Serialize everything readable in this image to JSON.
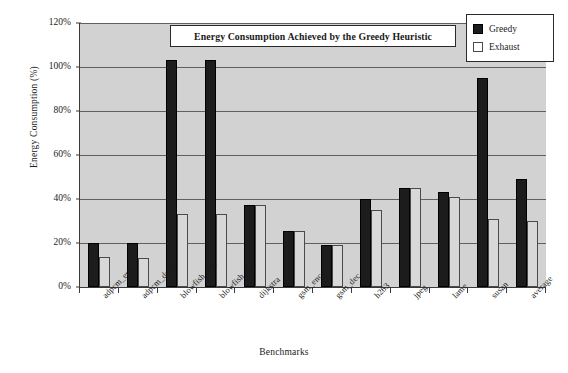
{
  "chart_data": {
    "type": "bar",
    "title": "Energy Consumption Achieved by the Greedy Heuristic",
    "xlabel": "Benchmarks",
    "ylabel": "Energy Consumption (%)",
    "ylim": [
      0,
      120
    ],
    "ytick_labels": [
      "120%",
      "100%",
      "80%",
      "60%",
      "40%",
      "20%",
      "0%"
    ],
    "ytick_values": [
      120,
      100,
      80,
      60,
      40,
      20,
      0
    ],
    "grid": true,
    "legend_position": "top-right",
    "categories": [
      "adpcm_enc",
      "adpcm_dec",
      "blowfish_enc",
      "blowfish_dec",
      "dijkstra",
      "gsm_enc",
      "gsm_dec",
      "h263",
      "jpeg",
      "lame",
      "susan",
      "average"
    ],
    "series": [
      {
        "name": "Greedy",
        "color": "#1c1c1c",
        "values": [
          20,
          20,
          103,
          103,
          37.5,
          25.5,
          19,
          40,
          45,
          43,
          95,
          49
        ]
      },
      {
        "name": "Exhaust",
        "color": "#d8d8d8",
        "values": [
          13.5,
          13,
          33,
          33,
          37.5,
          25.5,
          19,
          35,
          45,
          41,
          31,
          30
        ]
      }
    ]
  },
  "legend": {
    "items": [
      {
        "label": "Greedy",
        "swatch": "filled-square-icon"
      },
      {
        "label": "Exhaust",
        "swatch": "open-square-icon"
      }
    ]
  },
  "colors": {
    "plot_background": "#d2d2d2",
    "page_background": "#ffffff",
    "axis": "#3a3a3a",
    "gridline": "#606060",
    "greedy": "#1c1c1c",
    "exhaust": "#d8d8d8"
  }
}
